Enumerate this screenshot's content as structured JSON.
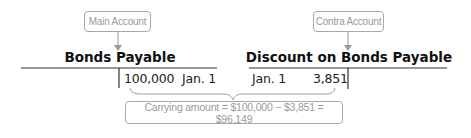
{
  "callouts": {
    "main": "Main Account",
    "contra": "Contra Account",
    "carrying": "Carrying amount = $100,000 − $3,851 = $96,149"
  },
  "accounts": [
    {
      "title": "Bonds Payable",
      "type": "main",
      "credit": {
        "amount": "100,000",
        "date": "Jan. 1"
      }
    },
    {
      "title": "Discount on Bonds Payable",
      "type": "contra",
      "debit": {
        "date": "Jan. 1",
        "amount": "3,851"
      }
    }
  ],
  "colors": {
    "callout_border": "#a8a8a8",
    "callout_text": "#9a9a9a",
    "line": "#333333"
  }
}
